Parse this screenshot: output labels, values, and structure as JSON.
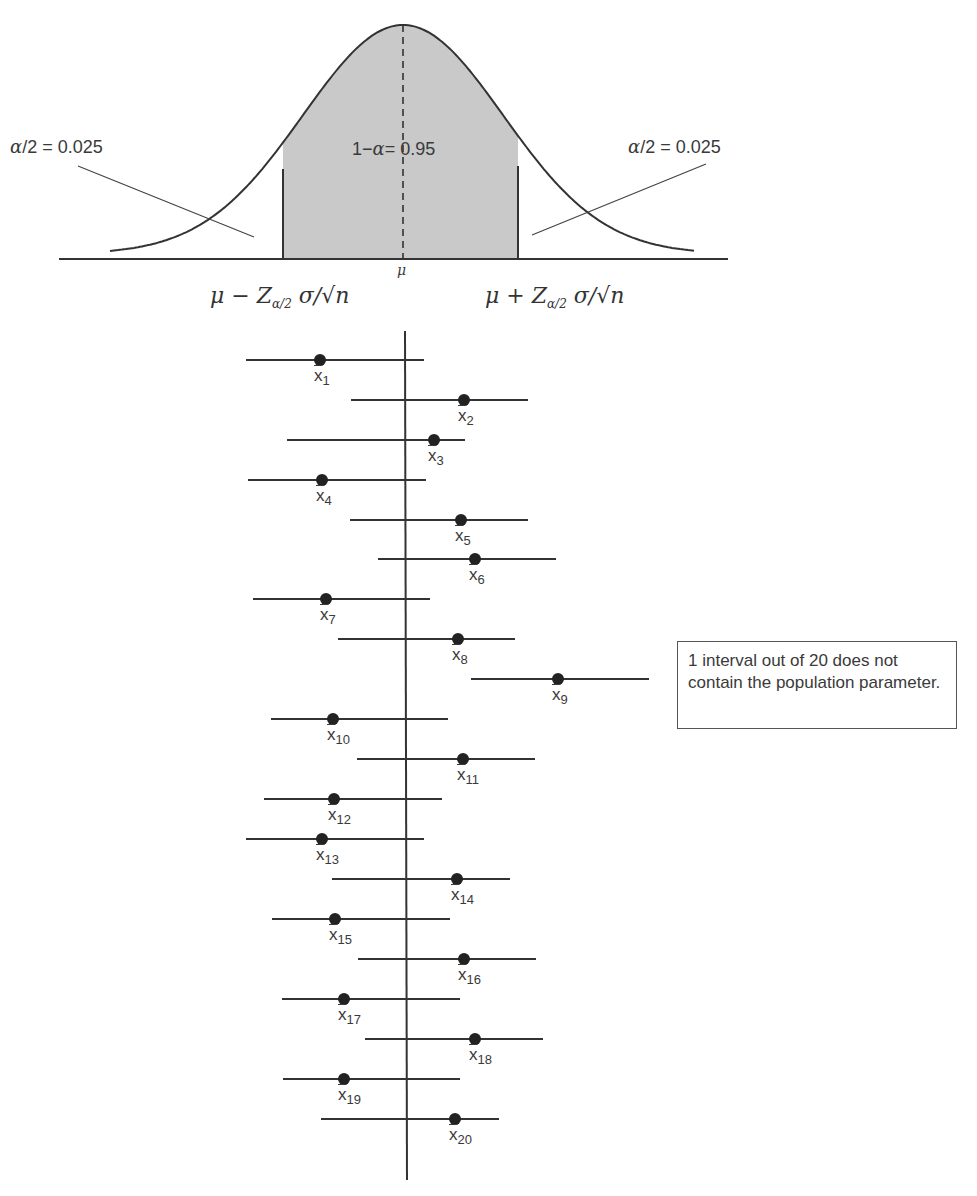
{
  "chart_data": {
    "type": "diagram-confidence-intervals",
    "title": "",
    "normal_curve": {
      "mean_label": "μ",
      "center_area_label": "1−α = 0.95",
      "left_tail_label": "α/2 = 0.025",
      "right_tail_label": "α/2 = 0.025",
      "lower_bound_label": "μ − Z_{α/2} σ/√n",
      "upper_bound_label": "μ + Z_{α/2} σ/√n",
      "confidence_level": 0.95,
      "alpha": 0.05,
      "shaded_color": "#c8c8c8"
    },
    "intervals": {
      "count": 20,
      "mu_axis_x": 405,
      "items": [
        {
          "label": "x̄1",
          "sub": "1",
          "y": 360,
          "left": 246,
          "right": 424,
          "mean": 320,
          "contains_mu": true
        },
        {
          "label": "x̄2",
          "sub": "2",
          "y": 400,
          "left": 351,
          "right": 528,
          "mean": 464,
          "contains_mu": true
        },
        {
          "label": "x̄3",
          "sub": "3",
          "y": 440,
          "left": 287,
          "right": 465,
          "mean": 434,
          "contains_mu": true
        },
        {
          "label": "x̄4",
          "sub": "4",
          "y": 480,
          "left": 248,
          "right": 426,
          "mean": 322,
          "contains_mu": true
        },
        {
          "label": "x̄5",
          "sub": "5",
          "y": 520,
          "left": 350,
          "right": 528,
          "mean": 461,
          "contains_mu": true
        },
        {
          "label": "x̄6",
          "sub": "6",
          "y": 559,
          "left": 378,
          "right": 556,
          "mean": 475,
          "contains_mu": true
        },
        {
          "label": "x̄7",
          "sub": "7",
          "y": 599,
          "left": 253,
          "right": 430,
          "mean": 326,
          "contains_mu": true
        },
        {
          "label": "x̄8",
          "sub": "8",
          "y": 639,
          "left": 338,
          "right": 515,
          "mean": 458,
          "contains_mu": true
        },
        {
          "label": "x̄9",
          "sub": "9",
          "y": 679,
          "left": 471,
          "right": 649,
          "mean": 558,
          "contains_mu": false
        },
        {
          "label": "x̄10",
          "sub": "10",
          "y": 719,
          "left": 271,
          "right": 448,
          "mean": 333,
          "contains_mu": true
        },
        {
          "label": "x̄11",
          "sub": "11",
          "y": 759,
          "left": 357,
          "right": 535,
          "mean": 463,
          "contains_mu": true
        },
        {
          "label": "x̄12",
          "sub": "12",
          "y": 799,
          "left": 264,
          "right": 442,
          "mean": 334,
          "contains_mu": true
        },
        {
          "label": "x̄13",
          "sub": "13",
          "y": 839,
          "left": 246,
          "right": 424,
          "mean": 322,
          "contains_mu": true
        },
        {
          "label": "x̄14",
          "sub": "14",
          "y": 879,
          "left": 332,
          "right": 510,
          "mean": 457,
          "contains_mu": true
        },
        {
          "label": "x̄15",
          "sub": "15",
          "y": 919,
          "left": 272,
          "right": 450,
          "mean": 335,
          "contains_mu": true
        },
        {
          "label": "x̄16",
          "sub": "16",
          "y": 959,
          "left": 358,
          "right": 536,
          "mean": 464,
          "contains_mu": true
        },
        {
          "label": "x̄17",
          "sub": "17",
          "y": 999,
          "left": 282,
          "right": 460,
          "mean": 344,
          "contains_mu": true
        },
        {
          "label": "x̄18",
          "sub": "18",
          "y": 1039,
          "left": 365,
          "right": 543,
          "mean": 475,
          "contains_mu": true
        },
        {
          "label": "x̄19",
          "sub": "19",
          "y": 1079,
          "left": 283,
          "right": 460,
          "mean": 344,
          "contains_mu": true
        },
        {
          "label": "x̄20",
          "sub": "20",
          "y": 1119,
          "left": 321,
          "right": 499,
          "mean": 455,
          "contains_mu": true
        }
      ]
    },
    "annotation": "1 interval out of 20 does not contain the population parameter.",
    "grid": false,
    "legend": null
  },
  "labels": {
    "left_tail": "α/2 = 0.025",
    "right_tail": "α/2 = 0.025",
    "center": "1−α = 0.95",
    "mu": "μ",
    "lower_bound_prefix": "μ − Z",
    "upper_bound_prefix": "μ + Z",
    "bound_sub": "α/2",
    "bound_suffix": " σ/√n",
    "xbar_symbol": "x",
    "note": "1 interval out of 20 does not contain the population parameter."
  }
}
